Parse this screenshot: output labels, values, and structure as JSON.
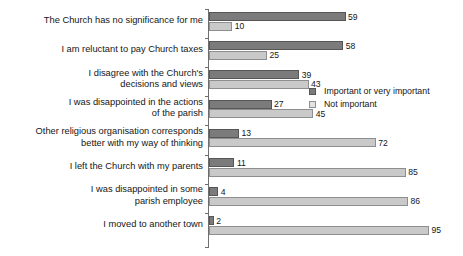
{
  "chart_data": {
    "type": "bar",
    "orientation": "horizontal",
    "title": "",
    "xlabel": "",
    "ylabel": "",
    "xlim": [
      0,
      100
    ],
    "grid": false,
    "legend_position": "middle-right",
    "categories": [
      "The Church has no significance for me",
      "I am reluctant to pay Church taxes",
      "I disagree with the Church's\ndecisions and views",
      "I was disappointed in the actions\nof the parish",
      "Other religious organisation corresponds\nbetter with my way of thinking",
      "I left the Church with my parents",
      "I was disappointed in some\nparish employee",
      "I moved to another town"
    ],
    "series": [
      {
        "name": "Important or very important",
        "color": "#7b7b7b",
        "values": [
          59,
          58,
          39,
          27,
          13,
          11,
          4,
          2
        ]
      },
      {
        "name": "Not important",
        "color": "#c9c9c9",
        "values": [
          10,
          25,
          43,
          45,
          72,
          85,
          86,
          95
        ]
      }
    ]
  }
}
